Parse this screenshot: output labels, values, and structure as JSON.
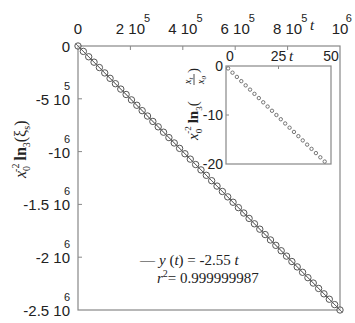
{
  "chart_data": [
    {
      "name": "main",
      "type": "scatter",
      "title": "",
      "xlabel": "t",
      "ylabel": "x0^-2 ln3(ξs)",
      "x_axis_position": "top",
      "xlim": [
        0,
        1000000
      ],
      "ylim": [
        -2500000,
        0
      ],
      "x_ticks": [
        {
          "value": 0,
          "mantissa": "0",
          "exp": ""
        },
        {
          "value": 200000,
          "mantissa": "2 10",
          "exp": "5"
        },
        {
          "value": 400000,
          "mantissa": "4 10",
          "exp": "5"
        },
        {
          "value": 600000,
          "mantissa": "6 10",
          "exp": "5"
        },
        {
          "value": 800000,
          "mantissa": "8 10",
          "exp": "5"
        },
        {
          "value": 1000000,
          "mantissa": "10",
          "exp": "6"
        }
      ],
      "y_ticks": [
        {
          "value": 0,
          "mantissa": "0",
          "exp": ""
        },
        {
          "value": -500000,
          "mantissa": "-5 10",
          "exp": "5"
        },
        {
          "value": -1000000,
          "mantissa": "-10",
          "exp": "6"
        },
        {
          "value": -1500000,
          "mantissa": "-1.5 10",
          "exp": "6"
        },
        {
          "value": -2000000,
          "mantissa": "-2 10",
          "exp": "6"
        },
        {
          "value": -2500000,
          "mantissa": "-2.5 10",
          "exp": "6"
        }
      ],
      "grid": false,
      "series": [
        {
          "name": "data",
          "marker": "circle-open",
          "n_points": 50,
          "x_start": 0,
          "x_end": 1000000,
          "slope": -2.55
        },
        {
          "name": "fit",
          "style": "line",
          "equation": "y(t) = -2.55 t"
        }
      ],
      "annotations": {
        "fit_label": "— y (t) = -2.55 t",
        "r2_label_prefix": "r",
        "r2_exp": "2",
        "r2_value": "= 0.999999987"
      }
    },
    {
      "name": "inset",
      "type": "scatter",
      "xlabel": "t",
      "ylabel": "x0^-2 ln3(xt/x0)",
      "x_axis_position": "top",
      "xlim": [
        0,
        50
      ],
      "ylim": [
        -20,
        0
      ],
      "x_ticks": [
        0,
        25,
        50
      ],
      "y_ticks": [
        0,
        -10,
        -20
      ],
      "series": [
        {
          "name": "data",
          "marker": "circle-open-small",
          "n_points": 23,
          "x_start": 1,
          "x_end": 47,
          "y_start": -0.5,
          "y_end": -19.5
        }
      ]
    }
  ],
  "labels": {
    "main_x_axis": "t",
    "inset_x_axis": "t",
    "main_y_base": "x",
    "main_y_sub": "0",
    "main_y_sup": "-2",
    "main_y_ln": "ln",
    "main_y_ln_sub": "3",
    "main_y_arg": "(ξ",
    "main_y_arg_sub": "s",
    "main_y_close": ")",
    "inset_y_base": "x",
    "inset_y_sub": "0",
    "inset_y_sup": "-2",
    "inset_y_ln": "ln",
    "inset_y_ln_sub": "3",
    "inset_y_frac_num": "x",
    "inset_y_frac_num_sub": "t",
    "inset_y_frac_den": "x",
    "inset_y_frac_den_sub": "0",
    "fit_dash": "—",
    "fit_text": "y (t) = -2.55 t",
    "r2_r": "r",
    "r2_sup": "2",
    "r2_text": "= 0.999999987"
  },
  "colors": {
    "axis": "#777777",
    "marker": "#555555",
    "text": "#222222"
  }
}
